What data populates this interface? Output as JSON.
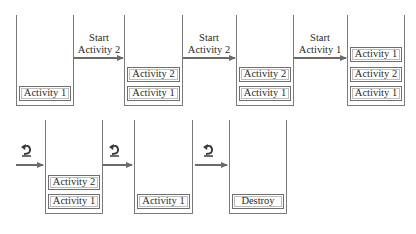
{
  "diagram": {
    "title": "",
    "top_row": {
      "stacks": [
        {
          "items": [
            "Activity 1"
          ]
        },
        {
          "items": [
            "Activity 2",
            "Activity 1"
          ]
        },
        {
          "items": [
            "Activity 2",
            "Activity 1"
          ]
        },
        {
          "items": [
            "Activity 1",
            "Activity 2",
            "Activity 1"
          ]
        }
      ],
      "transitions": [
        {
          "line1": "Start",
          "line2": "Activity 2"
        },
        {
          "line1": "Start",
          "line2": "Activity 2"
        },
        {
          "line1": "Start",
          "line2": "Activity 1"
        }
      ]
    },
    "bottom_row": {
      "stacks": [
        {
          "items": [
            "Activity 2",
            "Activity 1"
          ]
        },
        {
          "items": [
            "Activity 1"
          ]
        },
        {
          "items": [
            "Destroy"
          ]
        }
      ],
      "transitions": [
        {
          "icon": "back-icon"
        },
        {
          "icon": "back-icon"
        },
        {
          "icon": "back-icon"
        }
      ]
    },
    "colors": {
      "stroke": "#6f6f6f",
      "text": "#2a2a2a",
      "background": "#ffffff"
    }
  }
}
